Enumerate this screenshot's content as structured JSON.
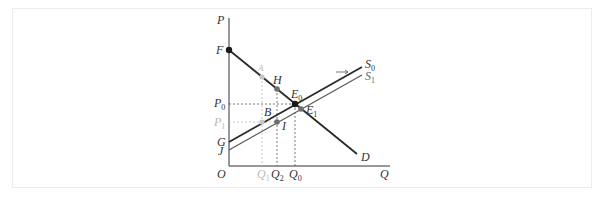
{
  "diagram": {
    "axes": {
      "y_label": "P",
      "x_label": "Q",
      "origin_label": "O"
    },
    "curves": [
      {
        "id": "D",
        "label": "D",
        "type": "demand"
      },
      {
        "id": "S0",
        "label": "S",
        "sub": "0",
        "type": "supply"
      },
      {
        "id": "S1",
        "label": "S",
        "sub": "1",
        "type": "supply"
      }
    ],
    "points": [
      {
        "id": "F",
        "label": "F"
      },
      {
        "id": "A",
        "label": "A",
        "faint": true
      },
      {
        "id": "H",
        "label": "H"
      },
      {
        "id": "E0",
        "label": "E",
        "sub": "0"
      },
      {
        "id": "E1",
        "label": "E",
        "sub": "1"
      },
      {
        "id": "B",
        "label": "B"
      },
      {
        "id": "I",
        "label": "I"
      },
      {
        "id": "G",
        "label": "G"
      },
      {
        "id": "J",
        "label": "J"
      }
    ],
    "price_ticks": [
      {
        "label": "P",
        "sub": "0"
      },
      {
        "label": "P",
        "sub": "1",
        "faint": true
      }
    ],
    "quantity_ticks": [
      {
        "label": "Q",
        "sub": "1",
        "faint": true
      },
      {
        "label": "Q",
        "sub": "2"
      },
      {
        "label": "Q",
        "sub": "0"
      }
    ],
    "colors": {
      "line": "#2a2a2a",
      "faint": "#b8b8b8",
      "marker_dark": "#1a1a1a",
      "marker_mid": "#6e6e6e"
    }
  }
}
